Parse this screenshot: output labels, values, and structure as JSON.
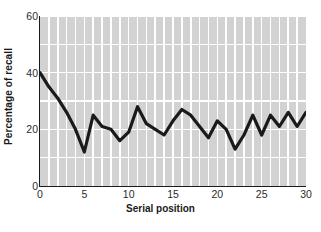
{
  "chart_data": {
    "type": "line",
    "title": "",
    "xlabel": "Serial position",
    "ylabel": "Percentage of recall",
    "xlim": [
      0,
      30
    ],
    "ylim": [
      0,
      60
    ],
    "xticks": [
      0,
      5,
      10,
      15,
      20,
      25,
      30
    ],
    "yticks": [
      0,
      20,
      40,
      60
    ],
    "grid": true,
    "grid_style": "vertical-bands-and-horizontal-lines",
    "legend": "none",
    "line_color": "#1a1a1a",
    "plot_background": "#d2d2d2",
    "gridline_color": "#ffffff",
    "x": [
      0,
      1,
      2,
      3,
      4,
      5,
      6,
      7,
      8,
      9,
      10,
      11,
      12,
      13,
      14,
      15,
      16,
      17,
      18,
      19,
      20,
      21,
      22,
      23,
      24,
      25,
      26,
      27,
      28,
      29,
      30
    ],
    "values": [
      40,
      35,
      31,
      26,
      20,
      12,
      25,
      21,
      20,
      16,
      19,
      28,
      22,
      20,
      18,
      23,
      27,
      25,
      21,
      17,
      23,
      20,
      13,
      18,
      25,
      18,
      25,
      21,
      26,
      21,
      26
    ],
    "series": [
      {
        "name": "Percentage of recall",
        "values": [
          40,
          35,
          31,
          26,
          20,
          12,
          25,
          21,
          20,
          16,
          19,
          28,
          22,
          20,
          18,
          23,
          27,
          25,
          21,
          17,
          23,
          20,
          13,
          18,
          25,
          18,
          25,
          21,
          26,
          21,
          26
        ]
      }
    ]
  },
  "axes": {
    "ylabel_text": "Percentage of recall",
    "xlabel_text": "Serial position",
    "ytick_labels": [
      "60",
      "40",
      "20",
      "0"
    ],
    "xtick_labels": [
      "0",
      "5",
      "10",
      "15",
      "20",
      "25",
      "30"
    ]
  }
}
